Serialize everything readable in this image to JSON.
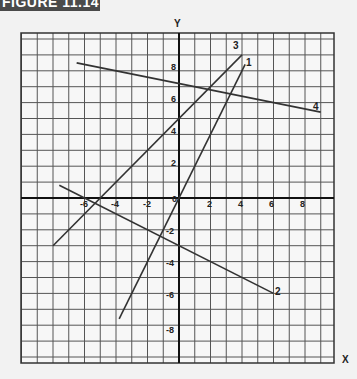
{
  "figure": {
    "title": "FIGURE 11.14"
  },
  "chart_data": {
    "type": "line",
    "title": "FIGURE 11.14",
    "xlabel": "X",
    "ylabel": "Y",
    "xlim": [
      -10,
      10
    ],
    "ylim": [
      -10.5,
      10.5
    ],
    "grid": true,
    "x_ticks": [
      -6,
      -4,
      -2,
      0,
      2,
      4,
      6,
      8
    ],
    "y_ticks": [
      8,
      6,
      4,
      2,
      0,
      -2,
      -4,
      -6,
      -8
    ],
    "series": [
      {
        "name": "1",
        "equation": "y = 2x",
        "points": [
          [
            -3.8,
            -7.6
          ],
          [
            4.2,
            8.4
          ]
        ]
      },
      {
        "name": "2",
        "equation": "y = -0.5x - 3",
        "points": [
          [
            -7.6,
            0.8
          ],
          [
            6,
            -6
          ]
        ]
      },
      {
        "name": "3",
        "equation": "y = x + 5",
        "points": [
          [
            -8,
            -3
          ],
          [
            4,
            9
          ]
        ]
      },
      {
        "name": "4",
        "equation": "y = -0.2x + 7.2",
        "points": [
          [
            -6.5,
            8.5
          ],
          [
            9,
            5.4
          ]
        ]
      }
    ]
  },
  "labels": {
    "x_axis": "X",
    "y_axis": "Y",
    "origin": "0",
    "line1": "1",
    "line2": "2",
    "line3": "3",
    "line4": "4",
    "xt_m6": "-6",
    "xt_m4": "-4",
    "xt_m2": "-2",
    "xt_2": "2",
    "xt_4": "4",
    "xt_6": "6",
    "xt_8": "8",
    "yt_8": "8",
    "yt_6": "6",
    "yt_4": "4",
    "yt_2": "2",
    "yt_m2": "-2",
    "yt_m4": "-4",
    "yt_m6": "-6",
    "yt_m8": "-8"
  }
}
